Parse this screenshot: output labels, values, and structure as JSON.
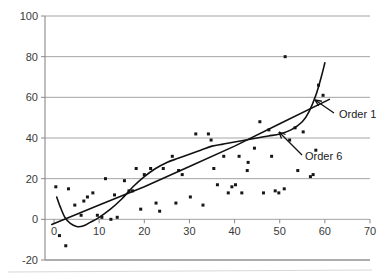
{
  "chart_data": {
    "type": "scatter",
    "title": "",
    "subtitle": "",
    "xlabel": "",
    "ylabel": "",
    "xlim": [
      -2,
      70
    ],
    "ylim": [
      -20,
      100
    ],
    "grid": true,
    "legend_position": "inline-annotations",
    "x_ticks": [
      0,
      10,
      20,
      30,
      40,
      50,
      60,
      70
    ],
    "y_ticks": [
      -20,
      0,
      20,
      40,
      60,
      80,
      100
    ],
    "x_tick_labels": [
      "0",
      "10",
      "20",
      "30",
      "40",
      "50",
      "60",
      "70"
    ],
    "y_tick_labels": [
      "-20",
      "0",
      "20",
      "40",
      "60",
      "80",
      "100"
    ],
    "series": [
      {
        "name": "data points",
        "type": "scatter",
        "marker": "square",
        "color": "#161616",
        "points": [
          [
            0.4,
            16
          ],
          [
            1.2,
            -8
          ],
          [
            2.6,
            -13
          ],
          [
            3.2,
            15
          ],
          [
            4.6,
            7
          ],
          [
            6.0,
            2
          ],
          [
            6.6,
            9
          ],
          [
            7.4,
            11
          ],
          [
            8.6,
            13
          ],
          [
            9.6,
            2
          ],
          [
            10.6,
            1
          ],
          [
            11.4,
            20
          ],
          [
            12.6,
            0
          ],
          [
            13.4,
            12
          ],
          [
            14.0,
            1
          ],
          [
            15.6,
            19
          ],
          [
            16.6,
            14
          ],
          [
            17.4,
            14
          ],
          [
            18.2,
            25
          ],
          [
            19.2,
            5
          ],
          [
            20.0,
            22
          ],
          [
            21.4,
            25
          ],
          [
            22.6,
            8
          ],
          [
            23.4,
            4
          ],
          [
            24.2,
            25
          ],
          [
            26.2,
            31
          ],
          [
            27.0,
            8
          ],
          [
            27.6,
            24
          ],
          [
            28.4,
            22
          ],
          [
            30.2,
            11
          ],
          [
            31.4,
            42
          ],
          [
            33.0,
            7
          ],
          [
            34.2,
            42
          ],
          [
            34.8,
            39
          ],
          [
            35.4,
            25
          ],
          [
            36.2,
            17
          ],
          [
            37.6,
            31
          ],
          [
            38.6,
            13
          ],
          [
            39.4,
            16
          ],
          [
            40.2,
            17
          ],
          [
            41.0,
            31
          ],
          [
            41.6,
            13
          ],
          [
            42.8,
            24
          ],
          [
            43.0,
            28
          ],
          [
            44.4,
            35
          ],
          [
            45.6,
            48
          ],
          [
            46.4,
            13
          ],
          [
            47.6,
            44
          ],
          [
            48.2,
            31
          ],
          [
            49.0,
            14
          ],
          [
            49.8,
            13
          ],
          [
            51.0,
            15
          ],
          [
            51.2,
            80
          ],
          [
            52.2,
            39
          ],
          [
            53.4,
            45
          ],
          [
            54.0,
            24
          ],
          [
            55.2,
            43
          ],
          [
            56.8,
            21
          ],
          [
            57.4,
            22
          ],
          [
            58.0,
            34
          ],
          [
            58.6,
            66
          ],
          [
            59.6,
            61
          ]
        ]
      },
      {
        "name": "Order 1",
        "type": "line",
        "color": "#111111",
        "description": "linear least-squares fit, rising from about -2 at x=0 to about 59 at x=61",
        "points": [
          [
            -0.5,
            -2.5
          ],
          [
            10,
            7
          ],
          [
            20,
            16
          ],
          [
            30,
            26
          ],
          [
            40,
            36
          ],
          [
            50,
            47
          ],
          [
            61,
            59
          ]
        ]
      },
      {
        "name": "Order 6",
        "type": "line",
        "color": "#111111",
        "description": "sixth-order polynomial fit; starts high near x=0, dips below zero near x=5, rises through the data, flattens near x=50 then turns sharply upward past x=57",
        "points": [
          [
            0.6,
            11
          ],
          [
            1.4,
            6
          ],
          [
            2.4,
            1
          ],
          [
            3.6,
            -2
          ],
          [
            5.0,
            -3.5
          ],
          [
            6.4,
            -3.3
          ],
          [
            8.0,
            -1.5
          ],
          [
            10.0,
            1
          ],
          [
            12.5,
            5
          ],
          [
            15.0,
            10
          ],
          [
            17.5,
            16
          ],
          [
            20.0,
            21
          ],
          [
            22.5,
            25
          ],
          [
            25.0,
            28
          ],
          [
            27.5,
            30
          ],
          [
            30.0,
            32
          ],
          [
            32.5,
            34
          ],
          [
            35.0,
            36
          ],
          [
            37.5,
            37
          ],
          [
            40.0,
            38
          ],
          [
            42.5,
            39
          ],
          [
            45.0,
            40
          ],
          [
            47.5,
            41
          ],
          [
            50.0,
            42
          ],
          [
            52.5,
            44
          ],
          [
            55.0,
            48
          ],
          [
            56.5,
            53
          ],
          [
            58.0,
            61
          ],
          [
            59.2,
            70
          ],
          [
            60.0,
            77
          ]
        ]
      }
    ],
    "annotations": [
      {
        "label": "Order 1",
        "label_x": 339,
        "label_y": 118,
        "arrow_from_x": 334,
        "arrow_from_y": 113,
        "arrow_to_x": 315,
        "arrow_to_y": 100,
        "target_series": "Order 1"
      },
      {
        "label": "Order 6",
        "label_x": 305,
        "label_y": 160,
        "arrow_from_x": 302,
        "arrow_from_y": 155,
        "arrow_to_x": 279,
        "arrow_to_y": 132,
        "target_series": "Order 6"
      }
    ]
  }
}
